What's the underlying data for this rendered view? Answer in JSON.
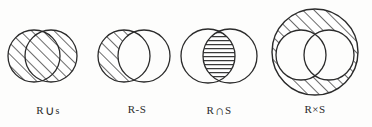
{
  "document": {
    "type": "set-operation-venn-diagrams",
    "background_color": "#fdfdfc",
    "ink_color": "#2b2b2b"
  },
  "figures": [
    {
      "id": "union",
      "caption_prefix": "R",
      "caption_operator": "∪",
      "caption_suffix": "s",
      "caption_plain": "R∪S",
      "description": "two overlapping circles, both circles fully hatched",
      "hatch_style": "diagonal",
      "shaded_region": "both-circles"
    },
    {
      "id": "difference",
      "caption_prefix": "R",
      "caption_operator": "-",
      "caption_suffix": "S",
      "caption_plain": "R-S",
      "description": "two overlapping circles, only the left circle minus the overlap is hatched",
      "hatch_style": "diagonal",
      "shaded_region": "left-circle-minus-overlap"
    },
    {
      "id": "intersection",
      "caption_prefix": "R",
      "caption_operator": "∩",
      "caption_suffix": "S",
      "caption_plain": "R∩S",
      "description": "two overlapping circles, only the lens shaped overlap is filled with horizontal lines",
      "hatch_style": "horizontal",
      "shaded_region": "overlap-lens"
    },
    {
      "id": "product",
      "caption_prefix": "R",
      "caption_operator": "×",
      "caption_suffix": "S",
      "caption_plain": "R×S",
      "description": "a large outer circle hatched diagonally containing two white overlapping inner circles",
      "hatch_style": "diagonal",
      "shaded_region": "outer-circle-minus-two-inner-circles"
    }
  ]
}
